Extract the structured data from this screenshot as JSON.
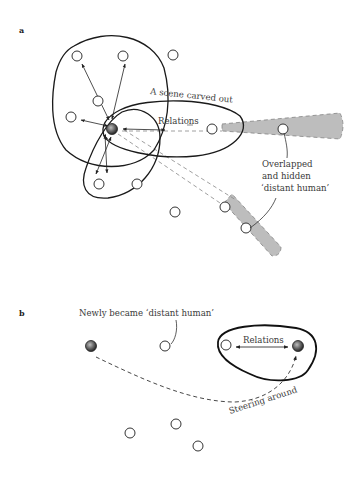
{
  "panel_a": {
    "label": "a",
    "scene_label": "A scene carved out",
    "relations_label": "Relations",
    "hidden_label_line1": "Overlapped",
    "hidden_label_line2": "and hidden",
    "hidden_label_line3": "‘distant human’"
  },
  "panel_b": {
    "label": "b",
    "newly_label": "Newly became ‘distant human’",
    "relations_label": "Relations",
    "steering_label": "Steering around"
  },
  "colors": {
    "stroke": "#1a1a1a",
    "beam_fill": "#bdbdbd",
    "agent_fill": "#555555",
    "text": "#3a3a3a"
  }
}
